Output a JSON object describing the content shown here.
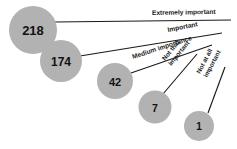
{
  "chart_data": {
    "type": "bar",
    "title": "",
    "subtitle": "",
    "xlabel": "",
    "ylabel": "",
    "categories": [
      "Extremely important",
      "Important",
      "Medium importance",
      "Not that important",
      "Not at all important"
    ],
    "values": [
      218,
      174,
      42,
      7,
      1
    ],
    "value_labels": [
      "218",
      "174",
      "42",
      "7",
      "1"
    ],
    "legend": [],
    "grid": false,
    "legend_position": "none"
  },
  "colors": {
    "bubble_fill": "#b2b2b2",
    "line": "#1a1a1a",
    "value_text": "#111111",
    "label_text": "#1a1a1a",
    "background": "#ffffff"
  },
  "bubbles": [
    {
      "value_label": "218",
      "category": "Extremely important",
      "cx": 33,
      "cy": 30,
      "r": 24,
      "font_size": 13
    },
    {
      "value_label": "174",
      "category": "Important",
      "cx": 61,
      "cy": 61,
      "r": 21,
      "font_size": 12
    },
    {
      "value_label": "42",
      "category": "Medium importance",
      "cx": 115,
      "cy": 81,
      "r": 18,
      "font_size": 11
    },
    {
      "value_label": "7",
      "category": "Not that important",
      "cx": 155,
      "cy": 107,
      "r": 16.5,
      "font_size": 10.5
    },
    {
      "value_label": "1",
      "category": "Not at all important",
      "cx": 199,
      "cy": 126,
      "r": 15,
      "font_size": 10
    }
  ],
  "leader_lines": [
    {
      "for": "Extremely important",
      "x1": 55,
      "y1": 22,
      "x2": 231,
      "y2": 20
    },
    {
      "for": "Important",
      "x1": 80,
      "y1": 56,
      "x2": 222,
      "y2": 33
    },
    {
      "for": "Medium importance",
      "x1": 131,
      "y1": 73,
      "x2": 212,
      "y2": 45
    },
    {
      "for": "Not that important",
      "x1": 163,
      "y1": 94,
      "x2": 197,
      "y2": 54
    },
    {
      "for": "Not at all important",
      "x1": 208,
      "y1": 113,
      "x2": 225,
      "y2": 67
    }
  ],
  "labels": [
    {
      "text": "Extremely important",
      "x": 152,
      "y": 15,
      "rotate": -1,
      "font_size": 6.6,
      "lines": [
        "Extremely important"
      ]
    },
    {
      "text": "Important",
      "x": 168,
      "y": 32,
      "rotate": -11,
      "font_size": 6.6,
      "lines": [
        "Important"
      ]
    },
    {
      "text": "Medium importance",
      "x": 133,
      "y": 59,
      "rotate": -18,
      "font_size": 6.6,
      "lines": [
        "Medium importance"
      ]
    },
    {
      "text": "Not that important",
      "x": 165,
      "y": 61,
      "rotate": -51,
      "font_size": 6.4,
      "lines": [
        "Not that",
        "important"
      ]
    },
    {
      "text": "Not at all important",
      "x": 200,
      "y": 74,
      "rotate": -62,
      "font_size": 6.4,
      "lines": [
        "Not at all",
        "important"
      ]
    }
  ]
}
